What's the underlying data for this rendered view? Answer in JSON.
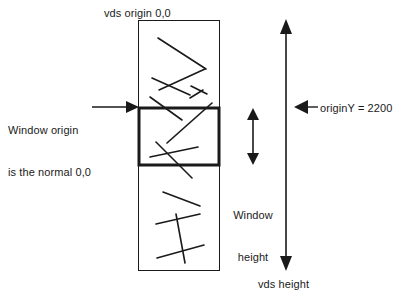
{
  "diagram": {
    "title_top": "vds origin 0,0",
    "labels": {
      "vds_origin": "vds origin 0,0",
      "window_origin_line1": "Window origin",
      "window_origin_line2": "is the normal 0,0",
      "origin_y": "originY = 2200",
      "window_height_line1": "Window",
      "window_height_line2": "height",
      "vds_height": "vds height"
    },
    "colors": {
      "stroke": "#1a1a1a",
      "background": "#ffffff",
      "text": "#1a1a1a"
    },
    "shapes": {
      "vds_rect": {
        "x": 138,
        "y": 20,
        "width": 81,
        "height": 250,
        "stroke_width": 1
      },
      "window_rect": {
        "x": 138,
        "y": 108,
        "width": 81,
        "height": 57,
        "stroke_width": 3
      }
    },
    "arrows": {
      "window_origin_arrow": {
        "from_x": 92,
        "to_x": 138,
        "y": 107,
        "direction": "right"
      },
      "origin_y_arrow": {
        "from_x": 318,
        "to_x": 296,
        "y": 107,
        "direction": "left"
      },
      "window_height_arrow": {
        "x": 253,
        "top_y": 110,
        "bottom_y": 163,
        "direction": "both"
      },
      "vds_height_arrow": {
        "x": 286,
        "top_y": 20,
        "bottom_y": 270,
        "direction": "both"
      }
    },
    "scribbles": {
      "top_section": [
        [
          158,
          38,
          205,
          68
        ],
        [
          204,
          68,
          159,
          90
        ],
        [
          152,
          78,
          188,
          94
        ],
        [
          193,
          85,
          206,
          93
        ],
        [
          190,
          97,
          202,
          90
        ],
        [
          151,
          98,
          180,
          117
        ]
      ],
      "window_section": [
        [
          151,
          97,
          184,
          118
        ],
        [
          211,
          103,
          168,
          142
        ],
        [
          156,
          143,
          190,
          175
        ],
        [
          151,
          156,
          197,
          148
        ]
      ],
      "bottom_section": [
        [
          163,
          192,
          199,
          205
        ],
        [
          157,
          223,
          199,
          214
        ],
        [
          176,
          215,
          184,
          262
        ],
        [
          157,
          257,
          203,
          245
        ]
      ]
    }
  }
}
